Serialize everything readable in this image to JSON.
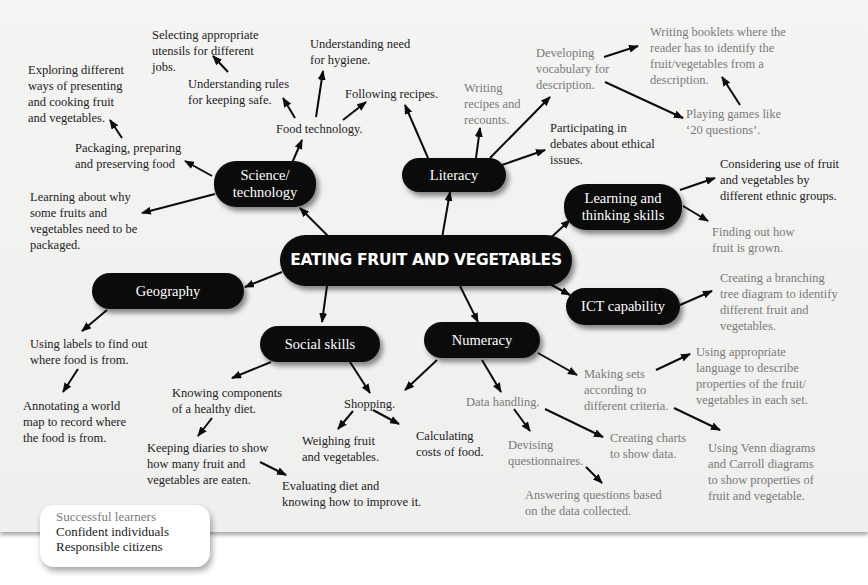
{
  "diagram": {
    "title": "EATING FRUIT AND VEGETABLES",
    "colors": {
      "node_bg": "#0b0b0b",
      "node_text": "#ffffff",
      "dark_text": "#222222",
      "grey_text": "#7a7a7a",
      "panel_bg": "#f2f2f1"
    },
    "nodes": {
      "science": "Science/\ntechnology",
      "literacy": "Literacy",
      "learning": "Learning and\nthinking skills",
      "geography": "Geography",
      "ict": "ICT capability",
      "social": "Social skills",
      "numeracy": "Numeracy"
    },
    "science_items": {
      "exploring": "Exploring different\nways of presenting\nand cooking fruit\nand vegetables.",
      "selecting": "Selecting appropriate\nutensils for different\njobs.",
      "hygiene": "Understanding need\nfor hygiene.",
      "rules": "Understanding rules\nfor keeping safe.",
      "following": "Following recipes.",
      "food_tech": "Food technology.",
      "packaging": "Packaging, preparing\nand preserving food",
      "learning_why": "Learning about why\nsome fruits and\nvegetables need to be\npackaged."
    },
    "literacy_items": {
      "writing_recipes": "Writing\nrecipes and\nrecounts.",
      "developing": "Developing\nvocabulary for\ndescription.",
      "booklets": "Writing booklets where the\nreader has to identify the\nfruit/vegetables from a\ndescription.",
      "games": "Playing games like\n‘20 questions’.",
      "debates": "Participating in\ndebates about ethical\nissues."
    },
    "learning_items": {
      "ethnic": "Considering use of fruit\nand vegetables by\ndifferent ethnic groups.",
      "grown": "Finding out how\nfruit is grown."
    },
    "ict_items": {
      "branching": "Creating a branching\ntree diagram to identify\ndifferent fruit and\nvegetables."
    },
    "geography_items": {
      "labels": "Using labels to find out\nwhere food is from.",
      "annotating": "Annotating a world\nmap to record where\nthe food is from."
    },
    "social_items": {
      "knowing": "Knowing components\nof a healthy diet.",
      "diaries": "Keeping diaries to show\nhow many fruit and\nvegetables are eaten.",
      "evaluating": "Evaluating diet and\nknowing how to improve it.",
      "shopping": "Shopping.",
      "weighing": "Weighing fruit\nand vegetables.",
      "calculating": "Calculating\ncosts of food."
    },
    "numeracy_items": {
      "data_handling": "Data handling.",
      "devising": "Devising\nquestionnaires.",
      "answering": "Answering questions based\non the data collected.",
      "charts": "Creating charts\nto show data.",
      "sets": "Making sets\naccording to\ndifferent criteria.",
      "language": "Using appropriate\nlanguage to describe\nproperties of the fruit/\nvegetables in each set.",
      "venn": "Using Venn diagrams\nand Carroll diagrams\nto show properties of\nfruit and vegetable."
    }
  },
  "legend": {
    "items": [
      {
        "label": "Successful learners",
        "color": "#7a7a7a"
      },
      {
        "label": "Confident individuals",
        "color": "#222222"
      },
      {
        "label": "Responsible citizens",
        "color": "#222222"
      }
    ]
  }
}
